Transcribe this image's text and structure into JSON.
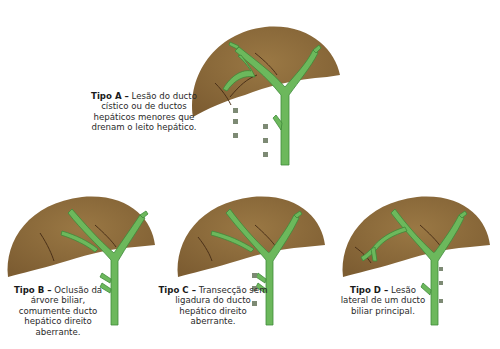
{
  "colors": {
    "liver": "#8a6a3a",
    "liver_dark": "#6b4f2a",
    "duct": "#6cb85c",
    "duct_outline": "#3f8a3a",
    "clip": "#7d8a74",
    "text": "#2a2a2a"
  },
  "panels": [
    {
      "id": "A",
      "title": "Tipo A –",
      "description": "Lesão do ducto cístico ou de ductos hepáticos menores que drenam o leito hepático."
    },
    {
      "id": "B",
      "title": "Tipo B –",
      "description": "Oclusão da árvore biliar, comumente ducto hepático direito aberrante."
    },
    {
      "id": "C",
      "title": "Tipo C –",
      "description": "Transecção sem ligadura do ducto hepático direito aberrante."
    },
    {
      "id": "D",
      "title": "Tipo D –",
      "description": "Lesão lateral de um ducto biliar principal."
    }
  ]
}
